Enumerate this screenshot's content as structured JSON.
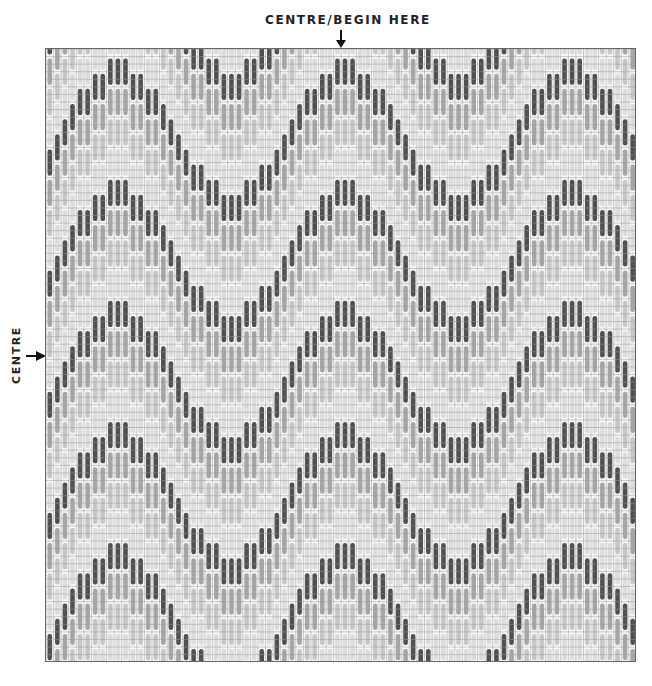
{
  "labels": {
    "top": "CENTRE/BEGIN HERE",
    "side": "CENTRE"
  },
  "icons": {
    "top_arrow": "down-arrow-icon",
    "side_arrow": "right-arrow-icon"
  },
  "grid": {
    "columns": 78,
    "rows": 81,
    "cell_px": 7.57,
    "line_color": "#9a9a9a",
    "background": "#f7f7f7"
  },
  "pattern": {
    "type": "bargello-flame-wave",
    "stitch_rows": 4,
    "wave_period_columns": 30,
    "peak_column": 39,
    "profile_column_widths": [
      3,
      2,
      2,
      1,
      1,
      1,
      1,
      2,
      2
    ],
    "profile_step_rows": 2,
    "first_peak_row": 1,
    "band_sequence": [
      "dark",
      "medium",
      "light",
      "lighter"
    ],
    "colors": {
      "dark": "#505050",
      "medium": "#a6a6a6",
      "light": "#c6c6c6",
      "lighter": "#dcdcdc"
    }
  }
}
